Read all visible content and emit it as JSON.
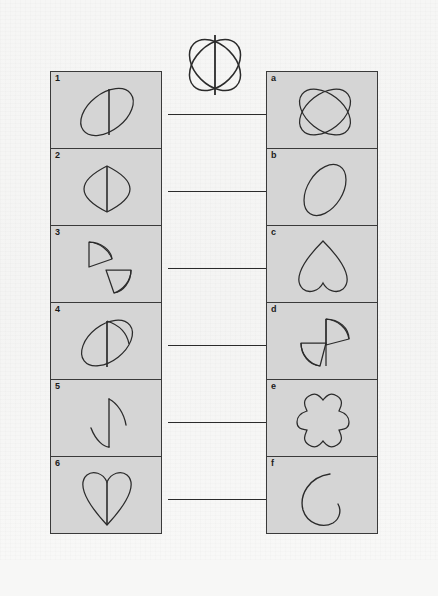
{
  "page": {
    "background_color": "#f7f7f6",
    "panel_fill_color": "#d5d5d5",
    "ink_color": "#2b2b2b",
    "footer_note": ""
  },
  "logo": {
    "name": "crossed-ellipses-emblem",
    "description": "Two crossed ellipses with a vertical centre line"
  },
  "left_column": {
    "heading": "",
    "items": [
      {
        "label": "1",
        "shape": "tilted-ellipse-with-vertical-chord"
      },
      {
        "label": "2",
        "shape": "curved-diamond-with-vertical-chord"
      },
      {
        "label": "3",
        "shape": "two-separated-half-discs"
      },
      {
        "label": "4",
        "shape": "tilted-ellipse-with-chord-and-arc"
      },
      {
        "label": "5",
        "shape": "zigzag-arc-pair"
      },
      {
        "label": "6",
        "shape": "heart-with-vertical-chord"
      }
    ]
  },
  "right_column": {
    "heading": "",
    "items": [
      {
        "label": "a",
        "shape": "two-crossed-ellipses"
      },
      {
        "label": "b",
        "shape": "tilted-ellipse"
      },
      {
        "label": "c",
        "shape": "inverted-heart"
      },
      {
        "label": "d",
        "shape": "two-half-discs-s-arrangement"
      },
      {
        "label": "e",
        "shape": "four-lobed-squircle"
      },
      {
        "label": "f",
        "shape": "open-c-curve"
      }
    ]
  },
  "answer_blanks": {
    "count": 6,
    "lines": [
      "",
      "",
      "",
      "",
      "",
      ""
    ]
  }
}
